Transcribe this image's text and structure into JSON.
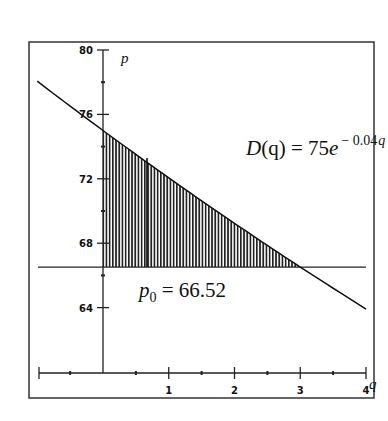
{
  "chart_data": {
    "type": "line",
    "title": "",
    "xlabel": "q",
    "ylabel": "p",
    "xlim": [
      -1,
      4
    ],
    "ylim": [
      62,
      80
    ],
    "x_ticks": [
      1,
      2,
      3,
      4
    ],
    "x_tick_labels": [
      "1",
      "2",
      "3",
      "4"
    ],
    "x_minor_ticks": [
      -0.5,
      0.5,
      1.5,
      2.5,
      3.5
    ],
    "y_ticks": [
      80,
      76,
      72,
      68,
      64
    ],
    "y_tick_labels": [
      "80",
      "76",
      "72",
      "68",
      "64"
    ],
    "y_minor_ticks": [
      78,
      74,
      70,
      66
    ],
    "grid": false,
    "series": [
      {
        "name": "D(q) = 75e^(-0.04q)",
        "function": "75*exp(-0.04*q)",
        "x": [
          -1,
          0,
          1,
          2,
          3,
          4
        ],
        "values": [
          78.06,
          75.0,
          72.06,
          69.24,
          66.52,
          63.91
        ]
      },
      {
        "name": "p0 = 66.52",
        "function": "66.52",
        "x": [
          -1,
          4
        ],
        "values": [
          66.52,
          66.52
        ]
      }
    ],
    "shaded_region": {
      "description": "Consumer surplus: area between D(q) and p0 from q=0 to q=3",
      "q_from": 0,
      "q_to": 3,
      "pattern": "vertical hatching"
    },
    "annotations": [
      {
        "text": "D(q) = 75e^(-0.04q)",
        "q": 2.3,
        "p": 73.5
      },
      {
        "text": "p0 = 66.52",
        "q": 0.55,
        "p": 65.2
      }
    ]
  },
  "labels": {
    "y_axis_var": "p",
    "x_axis_var": "q",
    "demand_lhs": "D",
    "demand_arg": "(q) = 75",
    "demand_e": "e",
    "demand_exp": "− 0.04",
    "demand_exp_var": "q",
    "p0_sym": "p",
    "p0_sub": "0",
    "p0_rhs": " = 66.52"
  },
  "ticks": {
    "x": [
      "1",
      "2",
      "3",
      "4"
    ],
    "y": [
      "80",
      "76",
      "72",
      "68",
      "64"
    ]
  }
}
